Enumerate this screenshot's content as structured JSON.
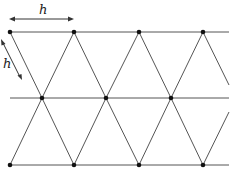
{
  "diagram": {
    "type": "triangular-lattice",
    "labels": {
      "horizontal_spacing": "h",
      "side_length": "h"
    },
    "rows": [
      {
        "y": 32,
        "nodes_x": [
          10,
          74,
          139,
          203
        ]
      },
      {
        "y": 98,
        "nodes_x": [
          42,
          106,
          171
        ]
      },
      {
        "y": 165,
        "nodes_x": [
          10,
          74,
          139,
          203
        ]
      }
    ],
    "colors": {
      "line": "#555555",
      "node": "#111111",
      "background": "#ffffff"
    }
  }
}
